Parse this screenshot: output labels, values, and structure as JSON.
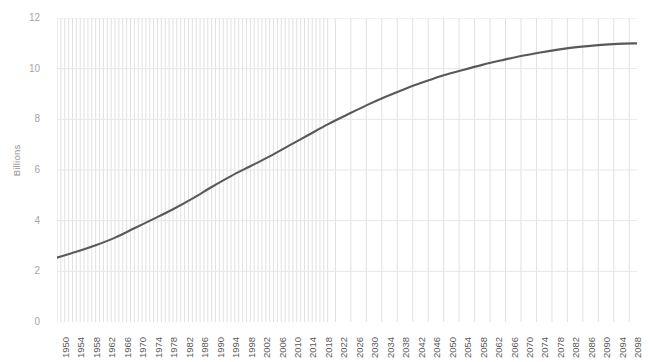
{
  "title_remnant": "",
  "chart_data": {
    "type": "line",
    "title": "",
    "subtitle": "",
    "xlabel": "",
    "ylabel": "Billions",
    "grid": true,
    "legend": false,
    "legend_position": "none",
    "line_color": "#595959",
    "gridline_color": "#e6e6e6",
    "dense_gridline_color": "#d9d9d9",
    "dense_gridline_end_year": 2020,
    "xlim": [
      1950,
      2100
    ],
    "ylim": [
      0,
      12
    ],
    "y_ticks": [
      12,
      10,
      8,
      6,
      4,
      2,
      0
    ],
    "x_ticks": [
      "1950",
      "1954",
      "1958",
      "1962",
      "1966",
      "1970",
      "1974",
      "1978",
      "1982",
      "1986",
      "1990",
      "1994",
      "1998",
      "2002",
      "2006",
      "2010",
      "2014",
      "2018",
      "2022",
      "2026",
      "2030",
      "2034",
      "2038",
      "2042",
      "2046",
      "2050",
      "2054",
      "2058",
      "2062",
      "2066",
      "2070",
      "2074",
      "2078",
      "2082",
      "2086",
      "2090",
      "2094",
      "2098"
    ],
    "series": [
      {
        "name": "World Population",
        "x": [
          1950,
          1955,
          1960,
          1965,
          1970,
          1975,
          1980,
          1985,
          1990,
          1995,
          2000,
          2005,
          2010,
          2015,
          2020,
          2025,
          2030,
          2035,
          2040,
          2045,
          2050,
          2055,
          2060,
          2065,
          2070,
          2075,
          2080,
          2085,
          2090,
          2095,
          2100
        ],
        "values": [
          2.54,
          2.77,
          3.03,
          3.33,
          3.7,
          4.07,
          4.45,
          4.87,
          5.33,
          5.76,
          6.15,
          6.54,
          6.96,
          7.38,
          7.8,
          8.18,
          8.55,
          8.89,
          9.2,
          9.48,
          9.74,
          9.95,
          10.15,
          10.33,
          10.5,
          10.64,
          10.76,
          10.86,
          10.93,
          10.98,
          11.0
        ]
      }
    ]
  }
}
